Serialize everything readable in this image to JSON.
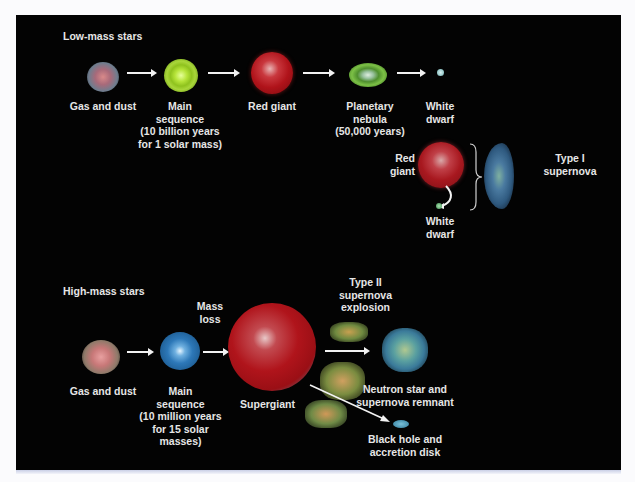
{
  "diagram": {
    "low_mass": {
      "heading": "Low-mass stars",
      "stages": [
        {
          "id": "gas-dust",
          "label": "Gas and dust"
        },
        {
          "id": "main-sequence",
          "label_lines": [
            "Main",
            "sequence",
            "(10 billion years",
            "for 1 solar mass)"
          ]
        },
        {
          "id": "red-giant",
          "label": "Red giant"
        },
        {
          "id": "planetary-nebula",
          "label_lines": [
            "Planetary",
            "nebula",
            "(50,000 years)"
          ]
        },
        {
          "id": "white-dwarf",
          "label_lines": [
            "White",
            "dwarf"
          ]
        }
      ],
      "binary": {
        "red_giant_lines": [
          "Red",
          "giant"
        ],
        "white_dwarf_lines": [
          "White",
          "dwarf"
        ],
        "result_lines": [
          "Type I",
          "supernova"
        ]
      }
    },
    "high_mass": {
      "heading": "High-mass stars",
      "mass_loss_lines": [
        "Mass",
        "loss"
      ],
      "stages": [
        {
          "id": "gas-dust",
          "label": "Gas and dust"
        },
        {
          "id": "main-sequence",
          "label_lines": [
            "Main",
            "sequence",
            "(10 million years",
            "for 15 solar",
            "masses)"
          ]
        },
        {
          "id": "supergiant",
          "label": "Supergiant"
        }
      ],
      "supernova_lines": [
        "Type II",
        "supernova",
        "explosion"
      ],
      "outcomes": [
        {
          "id": "neutron-star",
          "label_lines": [
            "Neutron star and",
            "supernova remnant"
          ]
        },
        {
          "id": "black-hole",
          "label_lines": [
            "Black hole and",
            "accretion disk"
          ]
        }
      ]
    },
    "colors": {
      "background": "#030303",
      "text": "#e6e6e6",
      "arrow": "#f2f2f2",
      "red_giant": "#b0131a",
      "main_sequence_low": "#8fc21e",
      "main_sequence_high": "#2d78b8",
      "planetary_nebula": "#5fa83a",
      "white_dwarf": "#8fc7c9"
    }
  }
}
